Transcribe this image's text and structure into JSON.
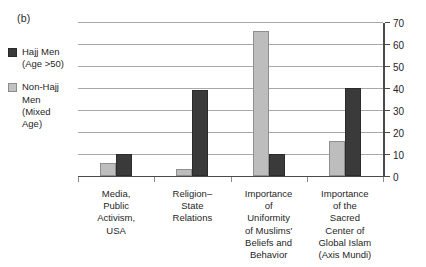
{
  "panel": {
    "label": "(b)"
  },
  "legend": {
    "position": "left",
    "items": [
      {
        "name": "hajj-men",
        "label": "Hajj Men\n(Age >50)",
        "color": "#3a3a3a"
      },
      {
        "name": "non-hajj-men",
        "label": "Non-Hajj\nMen\n(Mixed\nAge)",
        "color": "#bdbdbd"
      }
    ]
  },
  "chart_data": {
    "type": "bar",
    "title": "",
    "xlabel": "",
    "ylabel": "",
    "ylim": [
      0,
      70
    ],
    "yticks": [
      0,
      10,
      20,
      30,
      40,
      50,
      60,
      70
    ],
    "grid": true,
    "legend_position": "left",
    "categories": [
      "Media,\nPublic\nActivism,\nUSA",
      "Religion–\nState\nRelations",
      "Importance\nof\nUniformity\nof Muslims'\nBeliefs and\nBehavior",
      "Importance\nof the\nSacred\nCenter of\nGlobal Islam\n(Axis Mundi)"
    ],
    "series": [
      {
        "name": "Non-Hajj Men (Mixed Age)",
        "color": "#bdbdbd",
        "values": [
          6,
          3,
          66,
          16
        ]
      },
      {
        "name": "Hajj Men (Age >50)",
        "color": "#3a3a3a",
        "values": [
          10,
          39,
          10,
          40
        ]
      }
    ]
  }
}
